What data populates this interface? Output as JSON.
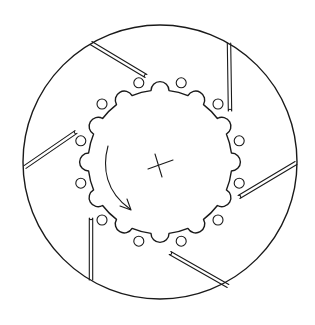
{
  "figure": {
    "stroke_color": "#1a1a1a",
    "background": "#ffffff"
  },
  "disc": {
    "center": [
      160,
      162
    ],
    "outer_radius": 137,
    "inner_scallop_count": 12,
    "inner_radius": 72,
    "scallop_radius": 9,
    "hole_count": 12,
    "hole_radius": 5,
    "hole_ring_radius": 82
  },
  "slots": [
    {
      "from": [
        91,
        43
      ],
      "to": [
        146,
        76
      ]
    },
    {
      "from": [
        229,
        43
      ],
      "to": [
        230,
        111
      ]
    },
    {
      "from": [
        296,
        163
      ],
      "to": [
        239,
        197
      ]
    },
    {
      "from": [
        228,
        286
      ],
      "to": [
        170,
        253
      ]
    },
    {
      "from": [
        91,
        280
      ],
      "to": [
        91,
        218
      ]
    },
    {
      "from": [
        25,
        167
      ],
      "to": [
        76,
        132
      ]
    }
  ],
  "center_mark": {
    "type": "cross"
  },
  "rotation_arrow": {
    "direction": "counter-clockwise"
  }
}
